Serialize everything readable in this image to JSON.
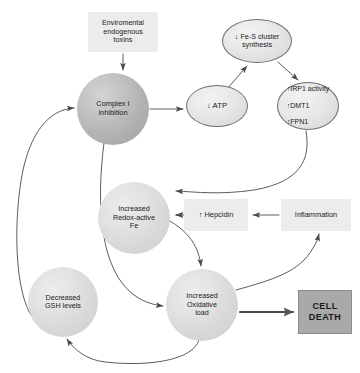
{
  "diagram": {
    "colors": {
      "background": "#ffffff",
      "circle_dark": "#b3b3b3",
      "circle_light": "#d8d8d8",
      "soft_box": "#ececec",
      "cell_death_box": "#a9a9a9",
      "arrow_stroke": "#4a4a4a",
      "text": "#1a1a1a"
    },
    "nodes": [
      {
        "id": "toxins",
        "shape": "rect",
        "text": "Enviromental\nendogenous\ntoxins",
        "x": 88,
        "y": 12,
        "w": 70,
        "h": 40,
        "font_size": 7.2
      },
      {
        "id": "complex-i",
        "shape": "circle",
        "text": "Complex I\ninhibition",
        "x": 77,
        "y": 73,
        "w": 72,
        "h": 72,
        "font_size": 7.4
      },
      {
        "id": "atp",
        "shape": "ellipse",
        "text": "↓ ATP",
        "x": 186,
        "y": 85,
        "w": 62,
        "h": 42,
        "font_size": 7.8
      },
      {
        "id": "fe-s-cluster",
        "shape": "ellipse",
        "text": "↓ Fe-S cluster\nsynthesis",
        "x": 222,
        "y": 19,
        "w": 70,
        "h": 44,
        "font_size": 7.2
      },
      {
        "id": "irp1-dmt1-fpn1",
        "shape": "ellipse",
        "lines": [
          "↑IRP1 activity",
          "↑DMT1",
          "↑FPN1"
        ],
        "text": "↑IRP1 activity\n↑DMT1\n↑FPN1",
        "x": 277,
        "y": 82,
        "w": 62,
        "h": 48,
        "font_size": 7.0
      },
      {
        "id": "redox-active-fe",
        "shape": "circle",
        "text": "Increased\nRedox-active\nFe",
        "x": 98,
        "y": 182,
        "w": 72,
        "h": 72,
        "font_size": 7.2
      },
      {
        "id": "hepcidin",
        "shape": "rect",
        "text": "↑ Hepcidin",
        "x": 184,
        "y": 199,
        "w": 64,
        "h": 32,
        "font_size": 7.4
      },
      {
        "id": "inflammation",
        "shape": "rect",
        "text": "Inflammation",
        "x": 281,
        "y": 199,
        "w": 70,
        "h": 32,
        "font_size": 7.4
      },
      {
        "id": "decreased-gsh",
        "shape": "circle",
        "text": "Decreased\nGSH levels",
        "x": 28,
        "y": 267,
        "w": 70,
        "h": 70,
        "font_size": 7.2
      },
      {
        "id": "oxidative-load",
        "shape": "circle",
        "text": "Increased\nOxidative\nload",
        "x": 166,
        "y": 269,
        "w": 72,
        "h": 72,
        "font_size": 7.2
      },
      {
        "id": "cell-death",
        "shape": "rect-solid",
        "text": "CELL\nDEATH",
        "x": 298,
        "y": 290,
        "w": 54,
        "h": 44,
        "font_size": 9.0
      }
    ],
    "edges": [
      {
        "id": "toxins-to-complex-i",
        "from": "toxins",
        "to": "complex-i",
        "style": "straight"
      },
      {
        "id": "complex-i-to-atp",
        "from": "complex-i",
        "to": "atp",
        "style": "straight"
      },
      {
        "id": "atp-to-fe-s",
        "from": "atp",
        "to": "fe-s-cluster",
        "style": "straight"
      },
      {
        "id": "fe-s-to-irp1",
        "from": "fe-s-cluster",
        "to": "irp1-dmt1-fpn1",
        "style": "straight"
      },
      {
        "id": "irp1-to-redox-fe",
        "from": "irp1-dmt1-fpn1",
        "to": "redox-active-fe",
        "style": "curved"
      },
      {
        "id": "inflammation-to-hepcidin",
        "from": "inflammation",
        "to": "hepcidin",
        "style": "straight"
      },
      {
        "id": "hepcidin-to-redox-fe",
        "from": "hepcidin",
        "to": "redox-active-fe",
        "style": "straight"
      },
      {
        "id": "redox-fe-to-oxidative-load",
        "from": "redox-active-fe",
        "to": "oxidative-load",
        "style": "curved"
      },
      {
        "id": "complex-i-to-oxidative-load",
        "from": "complex-i",
        "to": "oxidative-load",
        "style": "curved"
      },
      {
        "id": "gsh-to-complex-i",
        "from": "decreased-gsh",
        "to": "complex-i",
        "style": "curved"
      },
      {
        "id": "oxidative-load-to-gsh",
        "from": "oxidative-load",
        "to": "decreased-gsh",
        "style": "curved"
      },
      {
        "id": "oxidative-load-to-inflammation",
        "from": "oxidative-load",
        "to": "inflammation",
        "style": "curved"
      },
      {
        "id": "oxidative-load-to-cell-death",
        "from": "oxidative-load",
        "to": "cell-death",
        "style": "thick"
      }
    ]
  }
}
